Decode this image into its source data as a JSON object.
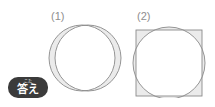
{
  "page": {
    "background_color": "#ffffff",
    "width": 215,
    "height": 107
  },
  "badge": {
    "name": "answer-badge",
    "furigana": "こた",
    "text": "答え",
    "background_color": "#3b3b3b",
    "text_color": "#ffffff"
  },
  "figures": [
    {
      "label": "(1)",
      "description": "two overlapping circles of equal size forming a shaded crescent (lune) on the left side",
      "stroke_color": "#7a7a7a",
      "fill_color": "#ebebeb",
      "shapes": [
        {
          "type": "circle",
          "cx": 44,
          "cy": 40,
          "r": 33
        },
        {
          "type": "circle",
          "cx": 38,
          "cy": 40,
          "r": 33
        }
      ]
    },
    {
      "label": "(2)",
      "description": "a square overlapped by a circle; the circle extends beyond the top and bottom edges while the square corners extend beyond the circle",
      "stroke_color": "#7a7a7a",
      "fill_color": "#ebebeb",
      "shapes": [
        {
          "type": "square",
          "x": 5,
          "y": 12,
          "size": 66
        },
        {
          "type": "circle",
          "cx": 38,
          "cy": 45,
          "r": 36
        }
      ]
    }
  ]
}
